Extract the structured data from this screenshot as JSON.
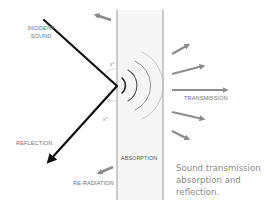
{
  "diagram": {
    "title": "Sound transmission absorption and reflection",
    "labels": {
      "incident_line1": "INCIDENT",
      "incident_line2": "SOUND",
      "reflection": "REFLECTION",
      "reradiation": "RE-RADIATION",
      "transmission": "TRANSMISSION",
      "absorption": "ABSORPTION",
      "angle_incident": "x°",
      "angle_reflected": "x°"
    },
    "caption": {
      "line1": "Sound transmission",
      "line2": "absorption and",
      "line3": "reflection."
    },
    "colors": {
      "incident_ray": "#111111",
      "arrows_gray": "#8c8c8c",
      "wall_fill": "#f4f4f4",
      "wall_border": "#9a9a9a",
      "label_text": "#6f6f6f",
      "caption_text": "#8a8a8a"
    },
    "elements": {
      "wall": {
        "x": 117,
        "y": 10,
        "width": 46,
        "height": 190
      },
      "incident_ray": {
        "from": [
          44,
          20
        ],
        "to": [
          117,
          85
        ]
      },
      "reflected_ray": {
        "from": [
          117,
          85
        ],
        "to": [
          44,
          166
        ]
      },
      "transmission_arrows": 5,
      "sound_waves": 4
    }
  }
}
